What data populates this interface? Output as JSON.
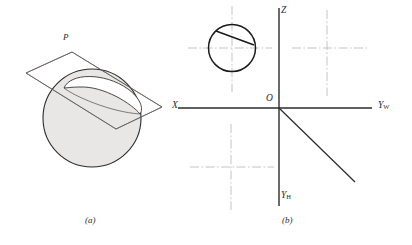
{
  "figure": {
    "background_color": "#ffffff",
    "ink_color": "#2b2b2b",
    "sphere_fill_color": "#e8e6e4",
    "centerline_color": "#b9b4ae",
    "thin_line_color": "#6d6a68"
  },
  "panel_a": {
    "caption": "(a)",
    "plane_label": "P",
    "description_names": {
      "sphere": "sphere-outline",
      "plane": "cutting-plane-parallelogram",
      "section": "elliptical-section-curve"
    }
  },
  "panel_b": {
    "caption": "(b)",
    "axes": {
      "z_label": "Z",
      "x_label": "X",
      "y_w_label": "Y",
      "y_w_subscript": "W",
      "y_h_label": "Y",
      "y_h_subscript": "H",
      "origin_label": "O"
    },
    "circle": {
      "name": "front-view-circle",
      "chord_name": "cutting-plane-edge-chord"
    },
    "centerlines": {
      "circle_cross": "circle-centerlines",
      "upper_right_cross": "top-view-centerlines",
      "lower_left_cross": "side-view-centerlines"
    },
    "diagonal": {
      "name": "miter-line"
    }
  }
}
